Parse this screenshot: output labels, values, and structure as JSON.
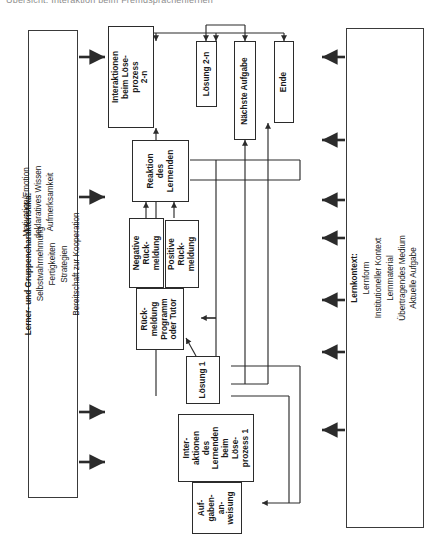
{
  "title": "Übersicht: Interaktion beim Fremdsprachenlernen",
  "left_panel": {
    "name": "lerner-und-gruppencharakteristika",
    "heading": "Lerner- und Gruppencharakteristika:",
    "items": [
      "Selbstwahrnehmung",
      "Fertigkeiten",
      "Strategien",
      "Bereitschaft zur Kooperation",
      "Motivation/Emotion",
      "deklaratives Wissen",
      "Aufmerksamkeit"
    ]
  },
  "right_panel": {
    "name": "lernkontext",
    "heading": "Lernkontext:",
    "items": [
      "Lernform",
      "Institutioneller Kontext",
      "Lernmaterial",
      "Übertragendes Medium",
      "Aktuelle Aufgabe"
    ]
  },
  "nodes": {
    "interaktionen_2n": "Interaktionen\nbeim Löse-\nprozess\n2-n",
    "loesung_2n": "Lösung 2-n",
    "naechste_aufgabe": "Nächste Aufgabe",
    "ende": "Ende",
    "reaktion_lernenden": "Reaktion\ndes\nLernenden",
    "negative_rueckmeldung": "Negative\nRück-\nmeldung",
    "positive_rueckmeldung": "Positive\nRück-\nmeldung",
    "rueckmeldung_tutor": "Rück-\nmeldung\nProgramm\noder Tutor",
    "loesung_1": "Lösung 1",
    "interaktionen_1": "Inter-\naktionen\ndes\nLernenden\nbeim\nLöse-\nprozess 1",
    "aufgabenanweisung": "Auf-\ngaben-\nan-\nweisung"
  },
  "colors": {
    "line": "#2b2b2b",
    "panel_border": "#3a3a3a",
    "background": "#ffffff",
    "title": "#8d8d8d"
  },
  "arrows": {
    "left_panel_out_count": 4,
    "right_panel_out_count": 7
  }
}
